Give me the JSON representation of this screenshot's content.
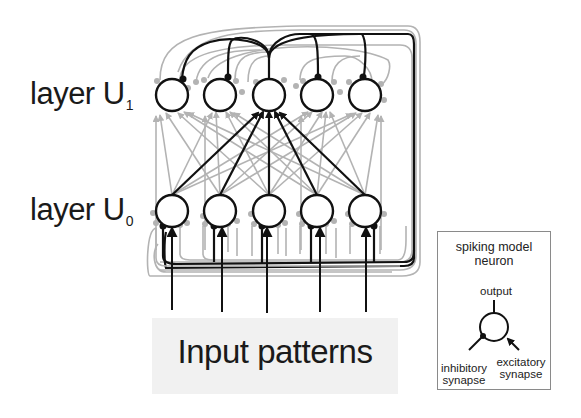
{
  "labels": {
    "layer_u1": "layer U",
    "layer_u1_sub": "1",
    "layer_u0": "layer U",
    "layer_u0_sub": "0",
    "input": "Input patterns"
  },
  "legend": {
    "title": "spiking model neuron",
    "output": "output",
    "inhibitory": "inhibitory synapse",
    "excitatory": "excitatory synapse"
  },
  "network": {
    "neurons_per_layer": 5,
    "neuron_x": [
      172,
      220,
      269,
      317,
      365
    ],
    "layer_u1_y": 95,
    "layer_u0_y": 211,
    "radius": 16,
    "highlighted_target_index": 2
  },
  "colors": {
    "strong": "#111111",
    "weak": "#b3b3b3",
    "legend_border": "#8a8a8a",
    "input_bg": "#f1f1f1"
  }
}
